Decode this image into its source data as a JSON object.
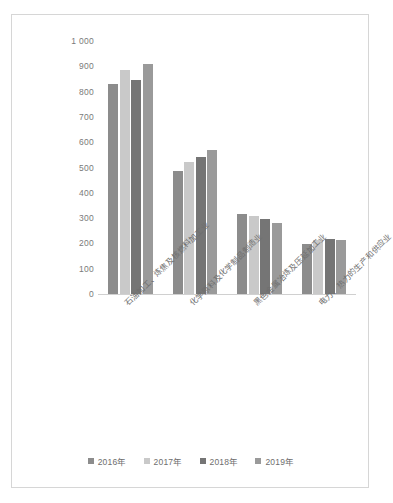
{
  "chart_data": {
    "type": "bar",
    "title": "",
    "subtitle": "",
    "xlabel": "",
    "ylabel": "",
    "ylim": [
      0,
      1000
    ],
    "ytick_labels": [
      "1 000",
      "900",
      "800",
      "700",
      "600",
      "500",
      "400",
      "300",
      "200",
      "100",
      "0"
    ],
    "ytick_values": [
      1000,
      900,
      800,
      700,
      600,
      500,
      400,
      300,
      200,
      100,
      0
    ],
    "grid": false,
    "legend_position": "bottom",
    "categories": [
      "石油加工、炼焦及核燃料加工业",
      "化学原料及化学制品制造业",
      "黑色金属冶炼及压延加工业",
      "电力、热力的生产和供应业"
    ],
    "series": [
      {
        "name": "2016年",
        "color": "#8c8c8c",
        "values": [
          830,
          485,
          315,
          196
        ]
      },
      {
        "name": "2017年",
        "color": "#c9c9c9",
        "values": [
          885,
          520,
          307,
          215
        ]
      },
      {
        "name": "2018年",
        "color": "#757575",
        "values": [
          845,
          540,
          295,
          218
        ]
      },
      {
        "name": "2019年",
        "color": "#9a9a9a",
        "values": [
          910,
          568,
          282,
          214
        ]
      }
    ]
  },
  "legend": {
    "items": [
      {
        "label": "2016年"
      },
      {
        "label": "2017年"
      },
      {
        "label": "2018年"
      },
      {
        "label": "2019年"
      }
    ]
  },
  "colors": {
    "frame_border": "#d6d6d6",
    "axis_line": "#d0d0d0",
    "tick_text": "#7a7a7a",
    "label_text": "#6e6e6e",
    "background": "#ffffff"
  }
}
